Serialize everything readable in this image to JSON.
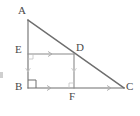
{
  "figure": {
    "stroke_color": "#6e6e6e",
    "label_color": "#4a4a4a",
    "background_color": "#ffffff",
    "points": {
      "A": {
        "label": "A",
        "x": 28,
        "y": 20,
        "label_x": 18,
        "label_y": 6
      },
      "B": {
        "label": "B",
        "x": 28,
        "y": 88,
        "label_x": 16,
        "label_y": 80
      },
      "C": {
        "label": "C",
        "x": 124,
        "y": 88,
        "label_x": 126,
        "label_y": 80
      },
      "D": {
        "label": "D",
        "x": 74,
        "y": 54,
        "label_x": 76,
        "label_y": 41
      },
      "E": {
        "label": "E",
        "x": 28,
        "y": 54,
        "label_x": 16,
        "label_y": 43
      },
      "F": {
        "label": "F",
        "x": 74,
        "y": 88,
        "label_x": 68,
        "label_y": 90
      }
    },
    "segments": [
      {
        "name": "segment-AB",
        "from": "A",
        "to": "B"
      },
      {
        "name": "segment-BC",
        "from": "B",
        "to": "C"
      },
      {
        "name": "segment-AC-hypotenuse",
        "from": "A",
        "to": "C"
      },
      {
        "name": "segment-ED",
        "from": "E",
        "to": "D"
      },
      {
        "name": "segment-DF",
        "from": "D",
        "to": "F"
      }
    ],
    "markers": {
      "right_angle_at_B": {
        "name": "right-angle-marker-B",
        "size": 8
      },
      "right_angle_at_E": {
        "name": "right-angle-marker-E",
        "size": 5
      },
      "right_angle_at_F": {
        "name": "right-angle-marker-F",
        "size": 5
      },
      "tick_on_ED": {
        "name": "tick-mark-ed",
        "count": 1
      },
      "tick_on_BF": {
        "name": "tick-mark-bf",
        "count": 1
      },
      "tick_on_FC": {
        "name": "tick-mark-fc",
        "count": 1
      }
    }
  }
}
